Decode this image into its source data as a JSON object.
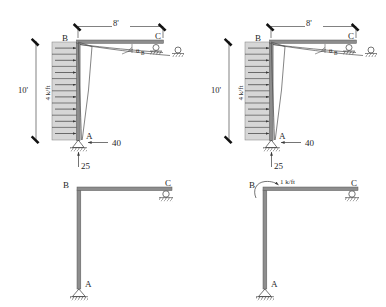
{
  "figure": {
    "panels": [
      {
        "id": "top-left",
        "name": "deflected-frame-with-loads-1",
        "joints": {
          "base": "A",
          "knee": "B",
          "far_end": "C"
        },
        "dimensions": {
          "span": "8'",
          "height": "10'"
        },
        "loads": {
          "distributed_label": "4 k/ft",
          "horizontal_reaction": "40",
          "vertical_reaction": "25"
        },
        "annotations": {
          "rotation": "θ",
          "rotation_sub": "B"
        },
        "supports": {
          "base": "pin",
          "far_end": "roller"
        }
      },
      {
        "id": "top-right",
        "name": "deflected-frame-with-loads-2",
        "joints": {
          "base": "A",
          "knee": "B",
          "far_end": "C"
        },
        "dimensions": {
          "span": "8'",
          "height": "10'"
        },
        "loads": {
          "distributed_label": "4 k/ft",
          "horizontal_reaction": "40",
          "vertical_reaction": "25"
        },
        "annotations": {
          "rotation": "θ",
          "rotation_sub": "B"
        },
        "supports": {
          "base": "pin",
          "far_end": "roller"
        }
      },
      {
        "id": "bottom-left",
        "name": "undeformed-frame",
        "joints": {
          "base": "A",
          "knee": "B",
          "far_end": "C"
        },
        "supports": {
          "base": "pin",
          "far_end": "roller"
        },
        "loads": {}
      },
      {
        "id": "bottom-right",
        "name": "frame-with-applied-moment",
        "joints": {
          "base": "A",
          "knee": "B",
          "far_end": "C"
        },
        "supports": {
          "base": "pin",
          "far_end": "roller"
        },
        "loads": {
          "moment_label": "1 k/ft"
        }
      }
    ]
  },
  "colors": {
    "member": "#8d8d8d",
    "member_stroke": "#5a5a5a",
    "load_block": "#d6d6d6",
    "ink": "#1f1f1f",
    "background": "#ffffff"
  }
}
